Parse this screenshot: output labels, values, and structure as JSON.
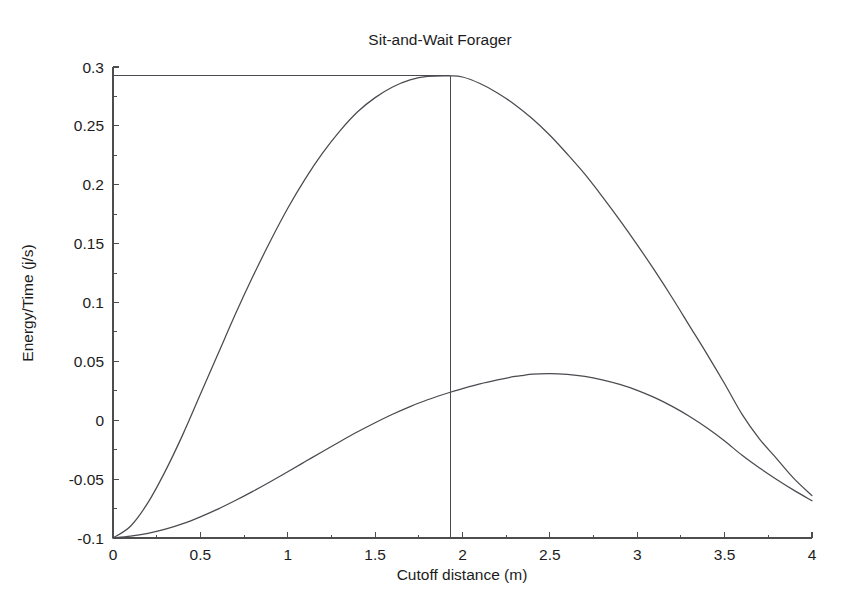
{
  "chart_data": {
    "type": "line",
    "title": "Sit-and-Wait Forager",
    "xlabel": "Cutoff distance (m)",
    "ylabel": "Energy/Time (j/s)",
    "xlim": [
      0,
      4
    ],
    "ylim": [
      -0.1,
      0.3
    ],
    "grid": false,
    "legend": "none",
    "xticks": [
      0,
      0.5,
      1,
      1.5,
      2,
      2.5,
      3,
      3.5,
      4
    ],
    "xticklabels": [
      "0",
      "0.5",
      "1",
      "1.5",
      "2",
      "2.5",
      "3",
      "3.5",
      "4"
    ],
    "yticks": [
      -0.1,
      -0.05,
      0,
      0.05,
      0.1,
      0.15,
      0.2,
      0.25,
      0.3
    ],
    "yticklabels": [
      "-0.1",
      "-0.05",
      "0",
      "0.05",
      "0.1",
      "0.15",
      "0.2",
      "0.25",
      "0.3"
    ],
    "series": [
      {
        "name": "upper-curve",
        "x": [
          0.0,
          0.1,
          0.2,
          0.3,
          0.4,
          0.5,
          0.6,
          0.7,
          0.8,
          0.9,
          1.0,
          1.1,
          1.2,
          1.3,
          1.4,
          1.5,
          1.6,
          1.7,
          1.8,
          1.93,
          2.0,
          2.1,
          2.2,
          2.3,
          2.4,
          2.5,
          2.6,
          2.7,
          2.8,
          2.9,
          3.0,
          3.1,
          3.2,
          3.3,
          3.4,
          3.5,
          3.6,
          3.7,
          3.8,
          3.9,
          4.0
        ],
        "y": [
          -0.1,
          -0.09,
          -0.07,
          -0.043,
          -0.012,
          0.022,
          0.056,
          0.09,
          0.122,
          0.152,
          0.18,
          0.205,
          0.227,
          0.246,
          0.262,
          0.274,
          0.283,
          0.289,
          0.292,
          0.2925,
          0.2915,
          0.286,
          0.278,
          0.268,
          0.256,
          0.242,
          0.226,
          0.209,
          0.19,
          0.17,
          0.149,
          0.127,
          0.104,
          0.08,
          0.056,
          0.031,
          0.005,
          -0.016,
          -0.033,
          -0.05,
          -0.064
        ]
      },
      {
        "name": "lower-curve",
        "x": [
          0.0,
          0.1,
          0.2,
          0.3,
          0.4,
          0.5,
          0.6,
          0.7,
          0.8,
          0.9,
          1.0,
          1.1,
          1.2,
          1.3,
          1.4,
          1.5,
          1.6,
          1.7,
          1.8,
          1.93,
          2.0,
          2.1,
          2.2,
          2.3,
          2.35,
          2.4,
          2.5,
          2.6,
          2.7,
          2.8,
          2.9,
          3.0,
          3.1,
          3.2,
          3.3,
          3.4,
          3.5,
          3.6,
          3.7,
          3.8,
          3.9,
          4.0
        ],
        "y": [
          -0.1,
          -0.0985,
          -0.096,
          -0.0925,
          -0.0878,
          -0.082,
          -0.0755,
          -0.0682,
          -0.0604,
          -0.0522,
          -0.0437,
          -0.0351,
          -0.0265,
          -0.018,
          -0.0098,
          -0.0021,
          0.0051,
          0.0116,
          0.0174,
          0.0238,
          0.0268,
          0.0308,
          0.0342,
          0.0372,
          0.0382,
          0.0392,
          0.0396,
          0.0389,
          0.0372,
          0.0343,
          0.0304,
          0.0254,
          0.0192,
          0.0118,
          0.0032,
          -0.0066,
          -0.0176,
          -0.0298,
          -0.0406,
          -0.0505,
          -0.0598,
          -0.0684
        ]
      }
    ],
    "annotations": [
      {
        "name": "optimum-marker-vertical",
        "type": "vline",
        "x": 1.93,
        "y_from": -0.1,
        "y_to": 0.2925
      },
      {
        "name": "optimum-marker-horizontal",
        "type": "hline",
        "y": 0.2925,
        "x_from": 0,
        "x_to": 1.93
      }
    ]
  },
  "colors": {
    "background": "#ffffff",
    "axis": "#4d4d4d",
    "curve": "#4a4a50",
    "text": "#1c1c1c"
  }
}
